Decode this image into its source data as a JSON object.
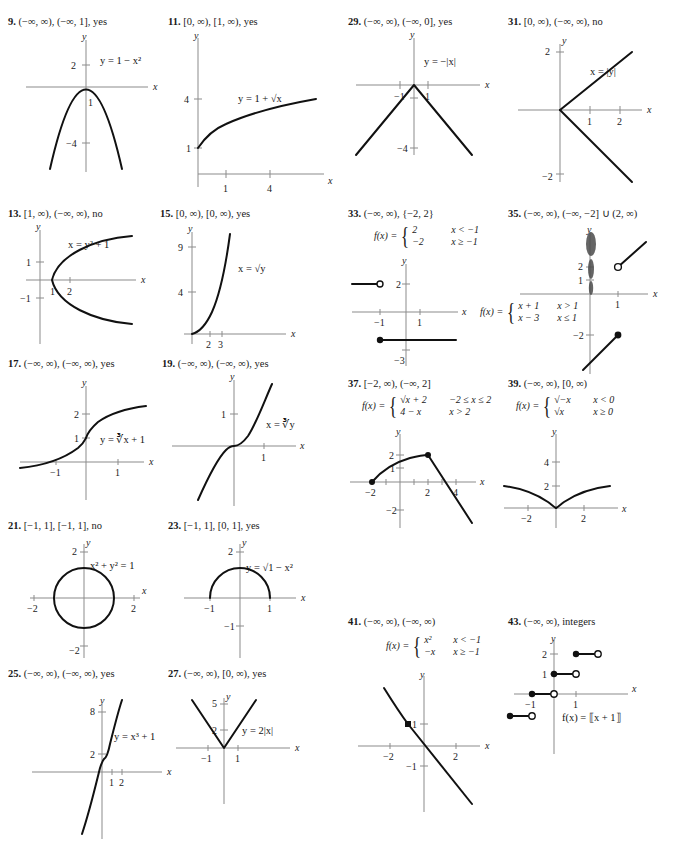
{
  "page": {
    "kind": "textbook-answer-key",
    "background": "#ffffff",
    "ink": "#111111",
    "axis_color": "#8b8b8b"
  },
  "exercises": [
    {
      "id": "ex9",
      "number": "9.",
      "answer": "(−∞, ∞), (−∞, 1], yes",
      "equation": "y = 1 − x²",
      "axis_x_label": "x",
      "axis_y_label": "y",
      "y_ticks": [
        "2",
        "−4"
      ],
      "x_ticks": [
        "1"
      ]
    },
    {
      "id": "ex11",
      "number": "11.",
      "answer": "[0, ∞), [1, ∞), yes",
      "equation": "y = 1 + √x",
      "axis_x_label": "x",
      "axis_y_label": "y",
      "y_ticks": [
        "4",
        "1"
      ],
      "x_ticks": [
        "1",
        "4"
      ]
    },
    {
      "id": "ex29",
      "number": "29.",
      "answer": "(−∞, ∞), (−∞, 0], yes",
      "equation": "y = −|x|",
      "axis_x_label": "x",
      "axis_y_label": "y",
      "y_ticks": [
        "−1",
        "−4"
      ],
      "x_ticks": [
        "−1",
        "1"
      ]
    },
    {
      "id": "ex31",
      "number": "31.",
      "answer": "[0, ∞), (−∞, ∞), no",
      "equation": "x = |y|",
      "axis_x_label": "x",
      "axis_y_label": "y",
      "y_ticks": [
        "2",
        "−2"
      ],
      "x_ticks": [
        "1",
        "2"
      ]
    },
    {
      "id": "ex13",
      "number": "13.",
      "answer": "[1, ∞), (−∞, ∞), no",
      "equation": "x = y² + 1",
      "axis_x_label": "x",
      "axis_y_label": "y",
      "y_ticks": [
        "1",
        "−1"
      ],
      "x_ticks": [
        "1",
        "2"
      ]
    },
    {
      "id": "ex15",
      "number": "15.",
      "answer": "[0, ∞), [0, ∞), yes",
      "equation": "x = √y",
      "axis_x_label": "x",
      "axis_y_label": "y",
      "y_ticks": [
        "9",
        "4"
      ],
      "x_ticks": [
        "2",
        "3"
      ]
    },
    {
      "id": "ex33",
      "number": "33.",
      "answer": "(−∞, ∞), {−2, 2}",
      "piecewise": {
        "lhs": "f(x) =",
        "rows": [
          {
            "value": "2",
            "condition": "x < −1"
          },
          {
            "value": "−2",
            "condition": "x ≥ −1"
          }
        ]
      },
      "axis_x_label": "x",
      "axis_y_label": "y",
      "y_ticks": [
        "2",
        "−3"
      ],
      "x_ticks": [
        "−1",
        "1"
      ]
    },
    {
      "id": "ex35",
      "number": "35.",
      "answer": "(−∞, ∞), (−∞, −2] ∪ (2, ∞)",
      "piecewise": {
        "lhs": "f(x) =",
        "rows": [
          {
            "value": "x + 1",
            "condition": "x > 1"
          },
          {
            "value": "x − 3",
            "condition": "x ≤ 1"
          }
        ]
      },
      "axis_x_label": "x",
      "axis_y_label": "y",
      "y_ticks": [
        "2",
        "1",
        "−2"
      ],
      "x_ticks": [
        "1"
      ]
    },
    {
      "id": "ex17",
      "number": "17.",
      "answer": "(−∞, ∞), (−∞, ∞), yes",
      "equation": "y = ∛x + 1",
      "axis_x_label": "x",
      "axis_y_label": "y",
      "y_ticks": [
        "2",
        "1"
      ],
      "x_ticks": [
        "−1",
        "1"
      ]
    },
    {
      "id": "ex19",
      "number": "19.",
      "answer": "(−∞, ∞), (−∞, ∞), yes",
      "equation": "x = ∛y",
      "axis_x_label": "x",
      "axis_y_label": "y",
      "y_ticks": [
        "1"
      ],
      "x_ticks": [
        "1"
      ]
    },
    {
      "id": "ex37",
      "number": "37.",
      "answer": "[−2, ∞), (−∞, 2]",
      "piecewise": {
        "lhs": "f(x) =",
        "rows": [
          {
            "value": "√x + 2",
            "condition": "−2 ≤ x ≤ 2"
          },
          {
            "value": "4 − x",
            "condition": "x > 2"
          }
        ]
      },
      "axis_x_label": "x",
      "axis_y_label": "y",
      "y_ticks": [
        "2",
        "1",
        "−2"
      ],
      "x_ticks": [
        "−2",
        "2",
        "4"
      ]
    },
    {
      "id": "ex39",
      "number": "39.",
      "answer": "(−∞, ∞), [0, ∞)",
      "piecewise": {
        "lhs": "f(x) =",
        "rows": [
          {
            "value": "√−x",
            "condition": "x < 0"
          },
          {
            "value": "√x",
            "condition": "x ≥ 0"
          }
        ]
      },
      "axis_x_label": "x",
      "axis_y_label": "y",
      "y_ticks": [
        "4",
        "2"
      ],
      "x_ticks": [
        "−2",
        "2"
      ]
    },
    {
      "id": "ex21",
      "number": "21.",
      "answer": "[−1, 1], [−1, 1], no",
      "equation": "x² + y² = 1",
      "axis_x_label": "x",
      "axis_y_label": "y",
      "y_ticks": [
        "2",
        "−2"
      ],
      "x_ticks": [
        "−2",
        "2"
      ]
    },
    {
      "id": "ex23",
      "number": "23.",
      "answer": "[−1, 1], [0, 1], yes",
      "equation": "y = √1 − x²",
      "axis_x_label": "x",
      "axis_y_label": "y",
      "y_ticks": [
        "2",
        "−1"
      ],
      "x_ticks": [
        "−1",
        "1"
      ]
    },
    {
      "id": "ex41",
      "number": "41.",
      "answer": "(−∞, ∞), (−∞, ∞)",
      "piecewise": {
        "lhs": "f(x) =",
        "rows": [
          {
            "value": "x²",
            "condition": "x < −1"
          },
          {
            "value": "−x",
            "condition": "x ≥ −1"
          }
        ]
      },
      "axis_x_label": "x",
      "axis_y_label": "y",
      "y_ticks": [
        "1",
        "−1"
      ],
      "x_ticks": [
        "−2",
        "2"
      ]
    },
    {
      "id": "ex43",
      "number": "43.",
      "answer": "(−∞, ∞), integers",
      "equation": "f(x) = ⟦x + 1⟧",
      "axis_x_label": "x",
      "axis_y_label": "y",
      "y_ticks": [
        "2",
        "1"
      ],
      "x_ticks": [
        "−1",
        "1"
      ]
    },
    {
      "id": "ex25",
      "number": "25.",
      "answer": "(−∞, ∞), (−∞, ∞), yes",
      "equation": "y = x³ + 1",
      "axis_x_label": "x",
      "axis_y_label": "y",
      "y_ticks": [
        "8",
        "2"
      ],
      "x_ticks": [
        "1",
        "2"
      ]
    },
    {
      "id": "ex27",
      "number": "27.",
      "answer": "(−∞, ∞), [0, ∞), yes",
      "equation": "y = 2|x|",
      "axis_x_label": "x",
      "axis_y_label": "y",
      "y_ticks": [
        "5",
        "2"
      ],
      "x_ticks": [
        "−1",
        "1"
      ]
    }
  ]
}
